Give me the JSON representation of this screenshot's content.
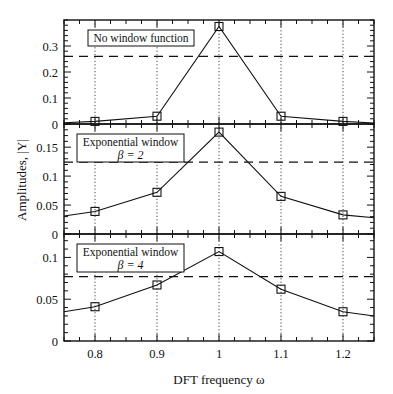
{
  "chart_data": {
    "type": "line",
    "layout": "3 vertically stacked panels sharing x-axis",
    "xlabel": "DFT frequency ω",
    "ylabel": "Amplitudes, |Y|",
    "xlim": [
      0.75,
      1.25
    ],
    "x_ticks": [
      0.8,
      0.9,
      1.0,
      1.1,
      1.2
    ],
    "x_tick_labels": [
      "0.8",
      "0.9",
      "1",
      "1.1",
      "1.2"
    ],
    "grid": "vertical dotted lines at x ticks",
    "panels": [
      {
        "legend_line1": "No window function",
        "legend_line2": "",
        "ylim": [
          0,
          0.4
        ],
        "y_ticks": [
          0,
          0.1,
          0.2,
          0.3
        ],
        "y_tick_labels": [
          "0",
          "0.1",
          "0.2",
          "0.3"
        ],
        "dashed_level": 0.26,
        "curve_x": [
          0.75,
          0.8,
          0.9,
          1.0,
          1.1,
          1.2,
          1.25
        ],
        "curve_y": [
          0.005,
          0.01,
          0.03,
          0.375,
          0.03,
          0.01,
          0.004
        ],
        "markers_x": [
          0.8,
          0.9,
          1.0,
          1.1,
          1.2
        ],
        "markers_y": [
          0.01,
          0.03,
          0.375,
          0.03,
          0.01
        ]
      },
      {
        "legend_line1": "Exponential window",
        "legend_line2": "β = 2",
        "ylim": [
          0,
          0.19
        ],
        "y_ticks": [
          0,
          0.05,
          0.1,
          0.15
        ],
        "y_tick_labels": [
          "0",
          "0.05",
          "0.1",
          "0.15"
        ],
        "dashed_level": 0.124,
        "curve_x": [
          0.75,
          0.8,
          0.9,
          1.0,
          1.1,
          1.2,
          1.25
        ],
        "curve_y": [
          0.031,
          0.039,
          0.072,
          0.176,
          0.065,
          0.033,
          0.028
        ],
        "markers_x": [
          0.8,
          0.9,
          1.0,
          1.1,
          1.2
        ],
        "markers_y": [
          0.039,
          0.072,
          0.176,
          0.065,
          0.033
        ]
      },
      {
        "legend_line1": "Exponential window",
        "legend_line2": "β = 4",
        "ylim": [
          0,
          0.128
        ],
        "y_ticks": [
          0,
          0.05,
          0.1
        ],
        "y_tick_labels": [
          "0",
          "0.05",
          "0.1"
        ],
        "dashed_level": 0.077,
        "curve_x": [
          0.75,
          0.8,
          0.9,
          1.0,
          1.1,
          1.2,
          1.25
        ],
        "curve_y": [
          0.035,
          0.041,
          0.067,
          0.107,
          0.062,
          0.035,
          0.03
        ],
        "markers_x": [
          0.8,
          0.9,
          1.0,
          1.1,
          1.2
        ],
        "markers_y": [
          0.041,
          0.067,
          0.107,
          0.062,
          0.035
        ]
      }
    ]
  },
  "labels": {
    "xlabel": "DFT frequency ω",
    "ylabel": "Amplitudes, |Y|"
  }
}
